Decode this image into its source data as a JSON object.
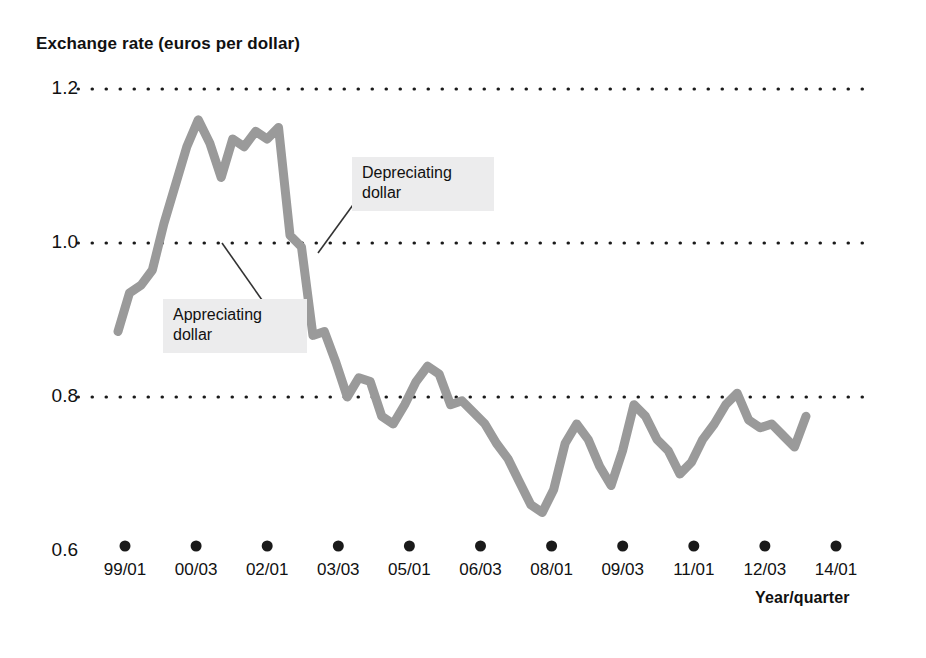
{
  "chart_data": {
    "type": "line",
    "title": "Exchange rate (euros per dollar)",
    "xlabel": "Year/quarter",
    "ylabel": "Exchange rate (euros per dollar)",
    "ylim": [
      0.6,
      1.2
    ],
    "yticks": [
      "1.2",
      "1.0",
      "0.8",
      "0.6"
    ],
    "ytick_values": [
      1.2,
      1.0,
      0.8,
      0.6
    ],
    "grid": "horizontal dotted gridlines at 1.2, 1.0 and 0.8",
    "legend": "none",
    "line_color": "#9a9a9a",
    "xticks": [
      "99/01",
      "00/03",
      "02/01",
      "03/03",
      "05/01",
      "06/03",
      "08/01",
      "09/03",
      "11/01",
      "12/03",
      "14/01"
    ],
    "x": [
      "99/01",
      "99/02",
      "99/03",
      "99/04",
      "00/01",
      "00/02",
      "00/03",
      "00/04",
      "01/01",
      "01/02",
      "01/03",
      "01/04",
      "02/01",
      "02/02",
      "02/03",
      "02/04",
      "03/01",
      "03/02",
      "03/03",
      "03/04",
      "04/01",
      "04/02",
      "04/03",
      "04/04",
      "05/01",
      "05/02",
      "05/03",
      "05/04",
      "06/01",
      "06/02",
      "06/03",
      "06/04",
      "07/01",
      "07/02",
      "07/03",
      "07/04",
      "08/01",
      "08/02",
      "08/03",
      "08/04",
      "09/01",
      "09/02",
      "09/03",
      "09/04",
      "10/01",
      "10/02",
      "10/03",
      "10/04",
      "11/01",
      "11/02",
      "11/03",
      "11/04",
      "12/01",
      "12/02",
      "12/03",
      "12/04",
      "13/01",
      "13/02",
      "13/03",
      "13/04",
      "14/01"
    ],
    "values": [
      0.885,
      0.935,
      0.945,
      0.965,
      1.025,
      1.075,
      1.125,
      1.16,
      1.13,
      1.085,
      1.135,
      1.125,
      1.145,
      1.135,
      1.15,
      1.01,
      0.995,
      0.88,
      0.885,
      0.845,
      0.8,
      0.825,
      0.82,
      0.775,
      0.765,
      0.79,
      0.82,
      0.84,
      0.83,
      0.79,
      0.795,
      0.78,
      0.765,
      0.74,
      0.72,
      0.69,
      0.66,
      0.65,
      0.68,
      0.74,
      0.765,
      0.745,
      0.71,
      0.685,
      0.73,
      0.79,
      0.775,
      0.745,
      0.73,
      0.7,
      0.715,
      0.745,
      0.765,
      0.79,
      0.805,
      0.77,
      0.76,
      0.765,
      0.75,
      0.735,
      0.775
    ],
    "annotations": [
      {
        "name": "appreciating-dollar",
        "text": "Appreciating\ndollar",
        "points_to": "rising segment near 00/01"
      },
      {
        "name": "depreciating-dollar",
        "text": "Depreciating\ndollar",
        "points_to": "falling segment near 02/04"
      }
    ]
  },
  "axes": {
    "y_title": "Exchange rate (euros per dollar)",
    "x_title": "Year/quarter",
    "y_labels": [
      "1.2",
      "1.0",
      "0.8",
      "0.6"
    ],
    "x_labels": [
      "99/01",
      "00/03",
      "02/01",
      "03/03",
      "05/01",
      "06/03",
      "08/01",
      "09/03",
      "11/01",
      "12/03",
      "14/01"
    ]
  },
  "annotations": {
    "appreciating": "Appreciating\ndollar",
    "depreciating": "Depreciating\ndollar"
  },
  "colors": {
    "line": "#9a9a9a",
    "grid": "#1a1a1a",
    "text": "#111111",
    "annotation_bg": "#ececed",
    "background": "#ffffff"
  }
}
